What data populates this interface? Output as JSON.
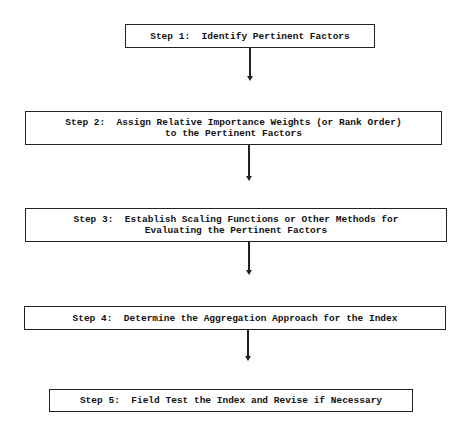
{
  "diagram": {
    "type": "flowchart",
    "steps": [
      {
        "id": "step1",
        "lines": [
          "Step 1:  Identify Pertinent Factors"
        ]
      },
      {
        "id": "step2",
        "lines": [
          "Step 2:  Assign Relative Importance Weights (or Rank Order)",
          "to the Pertinent Factors"
        ]
      },
      {
        "id": "step3",
        "lines": [
          "Step 3:  Establish Scaling Functions or Other Methods for",
          "Evaluating the Pertinent Factors"
        ]
      },
      {
        "id": "step4",
        "lines": [
          "Step 4:  Determine the Aggregation Approach for the Index"
        ]
      },
      {
        "id": "step5",
        "lines": [
          "Step 5:  Field Test the Index and Revise if Necessary"
        ]
      }
    ],
    "edges": [
      {
        "from": "step1",
        "to": "step2"
      },
      {
        "from": "step2",
        "to": "step3"
      },
      {
        "from": "step3",
        "to": "step4"
      },
      {
        "from": "step4",
        "to": "step5"
      }
    ]
  }
}
